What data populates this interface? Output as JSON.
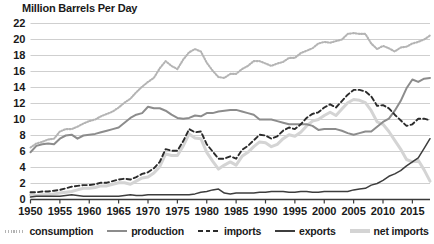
{
  "chart_data": {
    "type": "line",
    "title": "Million Barrels Per Day",
    "xlabel": "",
    "ylabel": "",
    "xlim": [
      1950,
      2018
    ],
    "ylim": [
      0,
      22
    ],
    "grid": true,
    "legend_position": "bottom",
    "y_ticks": [
      0,
      2,
      4,
      6,
      8,
      10,
      12,
      14,
      16,
      18,
      20,
      22
    ],
    "y_tick_labels": [
      "0",
      "2",
      "4",
      "6",
      "8",
      "10",
      "12",
      "14",
      "16",
      "18",
      "20",
      "22"
    ],
    "x_ticks": [
      1950,
      1955,
      1960,
      1965,
      1970,
      1975,
      1980,
      1985,
      1990,
      1995,
      2000,
      2005,
      2010,
      2015
    ],
    "x_tick_labels": [
      "1950",
      "1955",
      "1960",
      "1965",
      "1970",
      "1975",
      "1980",
      "1985",
      "1990",
      "1995",
      "2000",
      "2005",
      "2010",
      "2015"
    ],
    "x": [
      1950,
      1951,
      1952,
      1953,
      1954,
      1955,
      1956,
      1957,
      1958,
      1959,
      1960,
      1961,
      1962,
      1963,
      1964,
      1965,
      1966,
      1967,
      1968,
      1969,
      1970,
      1971,
      1972,
      1973,
      1974,
      1975,
      1976,
      1977,
      1978,
      1979,
      1980,
      1981,
      1982,
      1983,
      1984,
      1985,
      1986,
      1987,
      1988,
      1989,
      1990,
      1991,
      1992,
      1993,
      1994,
      1995,
      1996,
      1997,
      1998,
      1999,
      2000,
      2001,
      2002,
      2003,
      2004,
      2005,
      2006,
      2007,
      2008,
      2009,
      2010,
      2011,
      2012,
      2013,
      2014,
      2015,
      2016,
      2017,
      2018
    ],
    "series": [
      {
        "name": "consumption",
        "style": "dotted",
        "color": "#b4b4b4",
        "values": [
          6.5,
          7.0,
          7.2,
          7.5,
          7.6,
          8.5,
          8.8,
          8.8,
          9.1,
          9.5,
          9.8,
          10.0,
          10.4,
          10.7,
          11.0,
          11.5,
          12.1,
          12.6,
          13.4,
          14.1,
          14.7,
          15.2,
          16.4,
          17.3,
          16.7,
          16.3,
          17.5,
          18.4,
          18.8,
          18.5,
          17.1,
          16.1,
          15.3,
          15.2,
          15.7,
          15.7,
          16.3,
          16.7,
          17.3,
          17.3,
          17.0,
          16.7,
          17.0,
          17.2,
          17.7,
          17.7,
          18.3,
          18.6,
          18.9,
          19.5,
          19.7,
          19.6,
          19.8,
          20.0,
          20.7,
          20.8,
          20.7,
          20.7,
          19.5,
          18.8,
          19.2,
          18.9,
          18.5,
          19.0,
          19.1,
          19.5,
          19.7,
          20.0,
          20.5
        ]
      },
      {
        "name": "production",
        "style": "solid",
        "color": "#8c8c8c",
        "values": [
          5.9,
          6.7,
          6.9,
          7.0,
          6.9,
          7.6,
          8.0,
          8.1,
          7.6,
          8.0,
          8.1,
          8.2,
          8.4,
          8.6,
          8.8,
          9.0,
          9.6,
          10.2,
          10.6,
          10.8,
          11.6,
          11.4,
          11.4,
          11.1,
          10.6,
          10.2,
          10.1,
          10.2,
          10.5,
          10.4,
          10.8,
          10.8,
          11.0,
          11.1,
          11.2,
          11.2,
          11.0,
          10.8,
          10.6,
          10.0,
          10.0,
          10.0,
          9.8,
          9.6,
          9.4,
          9.4,
          9.4,
          9.4,
          9.2,
          8.7,
          8.8,
          8.8,
          8.8,
          8.6,
          8.3,
          8.1,
          8.3,
          8.5,
          8.5,
          9.1,
          9.7,
          10.1,
          11.1,
          12.3,
          13.9,
          15.0,
          14.7,
          15.1,
          15.2
        ]
      },
      {
        "name": "imports",
        "style": "dashed",
        "color": "#2b2b2b",
        "values": [
          0.9,
          0.9,
          1.0,
          1.0,
          1.1,
          1.2,
          1.4,
          1.6,
          1.7,
          1.8,
          1.8,
          1.9,
          2.1,
          2.1,
          2.3,
          2.5,
          2.6,
          2.5,
          2.8,
          3.2,
          3.4,
          3.9,
          4.7,
          6.3,
          6.1,
          6.1,
          7.3,
          8.8,
          8.4,
          8.5,
          6.9,
          6.0,
          5.1,
          5.1,
          5.4,
          5.1,
          6.2,
          6.7,
          7.4,
          8.1,
          8.0,
          7.6,
          7.9,
          8.6,
          9.0,
          8.8,
          9.4,
          10.2,
          10.7,
          10.9,
          11.5,
          11.9,
          11.5,
          12.3,
          13.1,
          13.7,
          13.7,
          13.5,
          12.9,
          11.7,
          11.8,
          11.4,
          10.6,
          9.9,
          9.2,
          9.4,
          10.1,
          10.1,
          9.9
        ]
      },
      {
        "name": "exports",
        "style": "solid",
        "color": "#3d3d3d",
        "values": [
          0.3,
          0.4,
          0.4,
          0.4,
          0.4,
          0.4,
          0.5,
          0.6,
          0.5,
          0.4,
          0.4,
          0.4,
          0.4,
          0.4,
          0.4,
          0.4,
          0.5,
          0.6,
          0.5,
          0.5,
          0.6,
          0.6,
          0.6,
          0.6,
          0.6,
          0.6,
          0.6,
          0.6,
          0.7,
          0.9,
          1.0,
          1.2,
          1.3,
          0.8,
          0.7,
          0.8,
          0.8,
          0.8,
          0.8,
          0.9,
          0.9,
          1.0,
          1.0,
          1.0,
          0.9,
          0.9,
          1.0,
          1.0,
          0.9,
          0.9,
          1.0,
          1.0,
          1.0,
          1.0,
          1.0,
          1.2,
          1.3,
          1.4,
          1.8,
          2.0,
          2.4,
          2.9,
          3.2,
          3.6,
          4.2,
          4.7,
          5.2,
          6.4,
          7.6
        ]
      },
      {
        "name": "net imports",
        "style": "solid",
        "color": "#d4d4d4",
        "values": [
          0.6,
          0.5,
          0.6,
          0.6,
          0.7,
          0.8,
          0.9,
          1.0,
          1.2,
          1.4,
          1.4,
          1.5,
          1.7,
          1.7,
          1.9,
          2.1,
          2.1,
          1.9,
          2.3,
          2.7,
          2.8,
          3.3,
          4.1,
          5.7,
          5.5,
          5.5,
          6.7,
          8.2,
          7.7,
          7.6,
          5.9,
          4.8,
          3.8,
          4.3,
          4.7,
          4.3,
          5.4,
          5.9,
          6.6,
          7.2,
          7.1,
          6.6,
          6.9,
          7.6,
          8.1,
          7.9,
          8.4,
          9.2,
          9.8,
          10.0,
          10.5,
          10.9,
          10.5,
          11.3,
          12.1,
          12.5,
          12.4,
          12.1,
          11.1,
          9.7,
          9.4,
          8.5,
          7.4,
          6.3,
          5.0,
          4.7,
          4.9,
          3.7,
          2.3
        ]
      }
    ]
  },
  "legend": {
    "items": [
      {
        "label": "consumption",
        "color": "#b4b4b4",
        "style": "dotted"
      },
      {
        "label": "production",
        "color": "#8c8c8c",
        "style": "solid"
      },
      {
        "label": "imports",
        "color": "#2b2b2b",
        "style": "dashed"
      },
      {
        "label": "exports",
        "color": "#3d3d3d",
        "style": "solid"
      },
      {
        "label": "net imports",
        "color": "#d4d4d4",
        "style": "solid"
      }
    ]
  }
}
